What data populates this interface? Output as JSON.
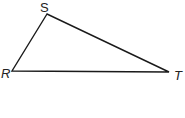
{
  "diagram": {
    "type": "triangle",
    "vertices": [
      {
        "name": "S",
        "x": 47,
        "y": 14,
        "label_x": 40,
        "label_y": 12
      },
      {
        "name": "R",
        "x": 12,
        "y": 71,
        "label_x": 1,
        "label_y": 78
      },
      {
        "name": "T",
        "x": 169,
        "y": 72,
        "label_x": 174,
        "label_y": 80
      }
    ],
    "stroke_color": "#1a1a1a"
  }
}
